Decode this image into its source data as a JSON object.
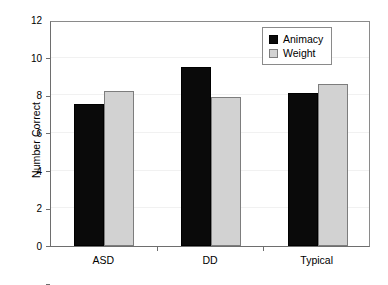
{
  "chart_data": {
    "type": "bar",
    "title": "",
    "xlabel": "",
    "ylabel": "Number Correct",
    "categories": [
      "ASD",
      "DD",
      "Typical"
    ],
    "series": [
      {
        "name": "Animacy",
        "color": "#0a0a0a",
        "values": [
          7.55,
          9.5,
          8.1
        ]
      },
      {
        "name": "Weight",
        "color": "#d2d2d2",
        "values": [
          8.25,
          7.9,
          8.6
        ]
      }
    ],
    "ylim": [
      0,
      12
    ],
    "yticks": [
      0,
      2,
      4,
      6,
      8,
      10,
      12
    ],
    "ytick_labels": [
      "0",
      "2",
      "4",
      "6",
      "8",
      "10",
      "12"
    ],
    "grid": true,
    "legend_position": "top-right"
  },
  "legend": {
    "entries": [
      {
        "label": "Animacy",
        "swatch": "black-square-swatch"
      },
      {
        "label": "Weight",
        "swatch": "gray-square-swatch"
      }
    ]
  }
}
